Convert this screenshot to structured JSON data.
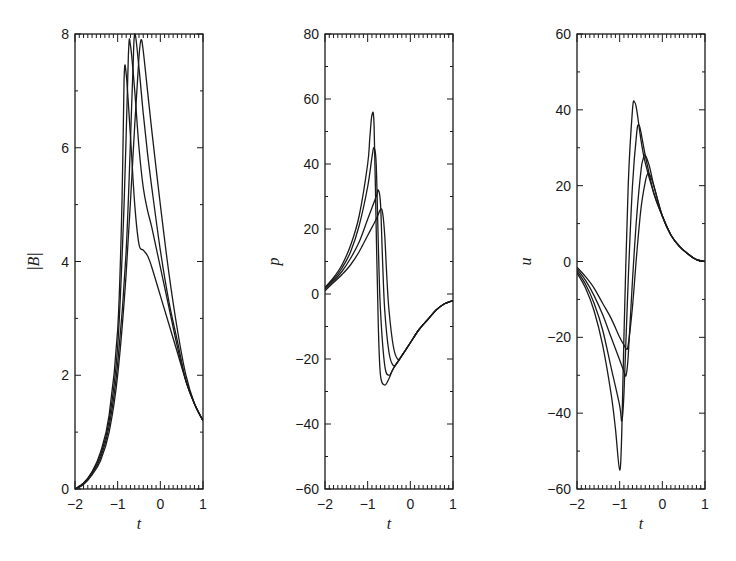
{
  "chart_data": [
    {
      "type": "line",
      "title": "",
      "xlabel": "t",
      "ylabel": "|B|",
      "xlim": [
        -2,
        1
      ],
      "ylim": [
        0,
        8
      ],
      "xticks": [
        -2,
        -1,
        0,
        1
      ],
      "yticks": [
        0,
        2,
        4,
        6,
        8
      ],
      "grid": false,
      "legend": null,
      "series": [
        {
          "name": "curve 1",
          "x": [
            -2,
            -1.8,
            -1.6,
            -1.4,
            -1.2,
            -1.0,
            -0.9,
            -0.85,
            -0.8,
            -0.7,
            -0.6,
            -0.5,
            -0.4,
            -0.3,
            -0.2,
            0,
            0.2,
            0.4,
            0.6,
            0.8,
            1.0
          ],
          "values": [
            0.0,
            0.1,
            0.3,
            0.65,
            1.3,
            2.8,
            5.0,
            7.2,
            7.3,
            6.2,
            5.0,
            4.3,
            4.2,
            4.1,
            3.9,
            3.4,
            2.9,
            2.4,
            1.9,
            1.5,
            1.2
          ]
        },
        {
          "name": "curve 2",
          "x": [
            -2,
            -1.8,
            -1.6,
            -1.4,
            -1.2,
            -1.0,
            -0.85,
            -0.75,
            -0.7,
            -0.6,
            -0.5,
            -0.4,
            -0.3,
            -0.2,
            0,
            0.2,
            0.4,
            0.6,
            0.8,
            1.0
          ],
          "values": [
            0.0,
            0.1,
            0.3,
            0.6,
            1.2,
            2.5,
            5.0,
            7.6,
            7.8,
            7.0,
            6.0,
            5.3,
            4.9,
            4.6,
            3.9,
            3.2,
            2.5,
            1.9,
            1.5,
            1.2
          ]
        },
        {
          "name": "curve 3",
          "x": [
            -2,
            -1.8,
            -1.6,
            -1.4,
            -1.2,
            -1.0,
            -0.8,
            -0.65,
            -0.6,
            -0.5,
            -0.4,
            -0.3,
            -0.2,
            0,
            0.2,
            0.4,
            0.6,
            0.8,
            1.0
          ],
          "values": [
            0.0,
            0.1,
            0.28,
            0.55,
            1.1,
            2.2,
            4.2,
            7.2,
            8.0,
            7.4,
            6.6,
            5.9,
            5.3,
            4.2,
            3.3,
            2.6,
            1.9,
            1.5,
            1.2
          ]
        },
        {
          "name": "curve 4",
          "x": [
            -2,
            -1.8,
            -1.6,
            -1.4,
            -1.2,
            -1.0,
            -0.8,
            -0.6,
            -0.5,
            -0.45,
            -0.4,
            -0.3,
            -0.2,
            0,
            0.2,
            0.4,
            0.6,
            0.8,
            1.0
          ],
          "values": [
            0.0,
            0.08,
            0.25,
            0.5,
            1.0,
            2.0,
            3.8,
            6.4,
            7.6,
            7.9,
            7.7,
            7.0,
            6.3,
            5.0,
            3.8,
            2.8,
            2.0,
            1.5,
            1.2
          ]
        }
      ]
    },
    {
      "type": "line",
      "title": "",
      "xlabel": "t",
      "ylabel": "p",
      "xlim": [
        -2,
        1
      ],
      "ylim": [
        -60,
        80
      ],
      "xticks": [
        -2,
        -1,
        0,
        1
      ],
      "yticks": [
        -60,
        -40,
        -20,
        0,
        20,
        40,
        60,
        80
      ],
      "grid": false,
      "legend": null,
      "series": [
        {
          "name": "curve 1",
          "x": [
            -2,
            -1.8,
            -1.6,
            -1.4,
            -1.2,
            -1.0,
            -0.95,
            -0.9,
            -0.85,
            -0.8,
            -0.75,
            -0.7,
            -0.6,
            -0.5,
            -0.4,
            -0.2,
            0,
            0.2,
            0.4,
            0.6,
            0.8,
            1.0
          ],
          "values": [
            2,
            5,
            9,
            15,
            24,
            40,
            48,
            55,
            52,
            20,
            -10,
            -25,
            -28,
            -26,
            -23,
            -19,
            -15,
            -11,
            -8,
            -5,
            -3,
            -2
          ]
        },
        {
          "name": "curve 2",
          "x": [
            -2,
            -1.8,
            -1.6,
            -1.4,
            -1.2,
            -1.0,
            -0.9,
            -0.85,
            -0.8,
            -0.75,
            -0.7,
            -0.6,
            -0.5,
            -0.4,
            -0.2,
            0,
            0.2,
            0.4,
            0.6,
            0.8,
            1.0
          ],
          "values": [
            2,
            4.5,
            8,
            13,
            21,
            33,
            42,
            45,
            40,
            15,
            -5,
            -22,
            -25,
            -23,
            -19,
            -15,
            -11,
            -8,
            -5,
            -3,
            -2
          ]
        },
        {
          "name": "curve 3",
          "x": [
            -2,
            -1.8,
            -1.6,
            -1.4,
            -1.2,
            -1.0,
            -0.8,
            -0.75,
            -0.7,
            -0.65,
            -0.6,
            -0.5,
            -0.4,
            -0.3,
            -0.2,
            0,
            0.2,
            0.4,
            0.6,
            0.8,
            1.0
          ],
          "values": [
            1.5,
            4,
            7,
            11,
            16,
            23,
            30,
            32,
            28,
            10,
            -5,
            -18,
            -22,
            -21,
            -19,
            -15,
            -11,
            -8,
            -5,
            -3,
            -2
          ]
        },
        {
          "name": "curve 4",
          "x": [
            -2,
            -1.8,
            -1.6,
            -1.4,
            -1.2,
            -1.0,
            -0.8,
            -0.7,
            -0.65,
            -0.6,
            -0.55,
            -0.5,
            -0.4,
            -0.3,
            -0.2,
            0,
            0.2,
            0.4,
            0.6,
            0.8,
            1.0
          ],
          "values": [
            1,
            3.5,
            6,
            9,
            13,
            18,
            23,
            26,
            25,
            18,
            5,
            -5,
            -16,
            -20,
            -19,
            -15,
            -11,
            -8,
            -5,
            -3,
            -2
          ]
        }
      ]
    },
    {
      "type": "line",
      "title": "",
      "xlabel": "t",
      "ylabel": "u",
      "xlim": [
        -2,
        1
      ],
      "ylim": [
        -60,
        60
      ],
      "xticks": [
        -2,
        -1,
        0,
        1
      ],
      "yticks": [
        -60,
        -40,
        -20,
        0,
        20,
        40,
        60
      ],
      "grid": false,
      "legend": null,
      "series": [
        {
          "name": "curve 1",
          "x": [
            -2,
            -1.8,
            -1.6,
            -1.4,
            -1.2,
            -1.1,
            -1.0,
            -0.95,
            -0.9,
            -0.8,
            -0.7,
            -0.65,
            -0.6,
            -0.5,
            -0.4,
            -0.2,
            0,
            0.2,
            0.4,
            0.6,
            0.8,
            1.0
          ],
          "values": [
            -3,
            -7,
            -13,
            -22,
            -35,
            -44,
            -55,
            -45,
            -20,
            20,
            40,
            42,
            40,
            32,
            26,
            18,
            12,
            7,
            4,
            2,
            0.5,
            0
          ]
        },
        {
          "name": "curve 2",
          "x": [
            -2,
            -1.8,
            -1.6,
            -1.4,
            -1.2,
            -1.0,
            -0.95,
            -0.9,
            -0.8,
            -0.7,
            -0.6,
            -0.55,
            -0.5,
            -0.4,
            -0.2,
            0,
            0.2,
            0.4,
            0.6,
            0.8,
            1.0
          ],
          "values": [
            -2.5,
            -6,
            -11,
            -18,
            -28,
            -38,
            -42,
            -35,
            -5,
            20,
            34,
            36,
            34,
            28,
            18,
            12,
            7,
            4,
            2,
            0.5,
            0
          ]
        },
        {
          "name": "curve 3",
          "x": [
            -2,
            -1.8,
            -1.6,
            -1.4,
            -1.2,
            -1.0,
            -0.9,
            -0.85,
            -0.8,
            -0.7,
            -0.6,
            -0.5,
            -0.45,
            -0.4,
            -0.3,
            -0.2,
            0,
            0.2,
            0.4,
            0.6,
            0.8,
            1.0
          ],
          "values": [
            -2,
            -5,
            -9,
            -14,
            -20,
            -26,
            -29,
            -30,
            -25,
            -5,
            12,
            24,
            27,
            28,
            25,
            20,
            12,
            7,
            4,
            2,
            0.5,
            0
          ]
        },
        {
          "name": "curve 4",
          "x": [
            -2,
            -1.8,
            -1.6,
            -1.4,
            -1.2,
            -1.0,
            -0.9,
            -0.85,
            -0.8,
            -0.7,
            -0.6,
            -0.5,
            -0.4,
            -0.35,
            -0.3,
            -0.2,
            0,
            0.2,
            0.4,
            0.6,
            0.8,
            1.0
          ],
          "values": [
            -1.5,
            -4,
            -7,
            -11,
            -15,
            -20,
            -22,
            -23,
            -22,
            -12,
            2,
            14,
            21,
            23,
            23,
            20,
            12,
            7,
            4,
            2,
            0.5,
            0
          ]
        }
      ]
    }
  ],
  "panels": [
    {
      "id": "B",
      "ylabel": "|B|",
      "xlabel": "t",
      "xtick_labels": [
        "−2",
        "−1",
        "0",
        "1"
      ],
      "ytick_labels": [
        "0",
        "2",
        "4",
        "6",
        "8"
      ]
    },
    {
      "id": "p",
      "ylabel": "p",
      "xlabel": "t",
      "xtick_labels": [
        "−2",
        "−1",
        "0",
        "1"
      ],
      "ytick_labels": [
        "−60",
        "−40",
        "−20",
        "0",
        "20",
        "40",
        "60",
        "80"
      ]
    },
    {
      "id": "u",
      "ylabel": "u",
      "xlabel": "t",
      "xtick_labels": [
        "−2",
        "−1",
        "0",
        "1"
      ],
      "ytick_labels": [
        "−60",
        "−40",
        "−20",
        "0",
        "20",
        "40",
        "60"
      ]
    }
  ],
  "style": {
    "line_color": "#1a1a1a",
    "axis_color": "#1a1a1a",
    "background": "#ffffff"
  }
}
